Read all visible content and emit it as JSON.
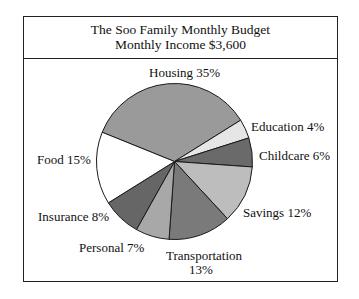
{
  "chart_data": {
    "type": "pie",
    "title": "The Soo Family Monthly Budget",
    "subtitle": "Monthly Income $3,600",
    "start_angle_deg": 292,
    "direction": "clockwise",
    "slices": [
      {
        "label": "Housing",
        "value": 35,
        "text": "Housing 35%",
        "color": "#9a9a9a"
      },
      {
        "label": "Education",
        "value": 4,
        "text": "Education 4%",
        "color": "#e6e6e6"
      },
      {
        "label": "Childcare",
        "value": 6,
        "text": "Childcare 6%",
        "color": "#6a6a6a"
      },
      {
        "label": "Savings",
        "value": 12,
        "text": "Savings 12%",
        "color": "#bdbdbd"
      },
      {
        "label": "Transportation",
        "value": 13,
        "text": "Transportation",
        "text2": "13%",
        "color": "#7a7a7a"
      },
      {
        "label": "Personal",
        "value": 7,
        "text": "Personal 7%",
        "color": "#a8a8a8"
      },
      {
        "label": "Insurance",
        "value": 8,
        "text": "Insurance 8%",
        "color": "#666666"
      },
      {
        "label": "Food",
        "value": 15,
        "text": "Food 15%",
        "color": "#ffffff"
      }
    ],
    "unit": "%"
  }
}
